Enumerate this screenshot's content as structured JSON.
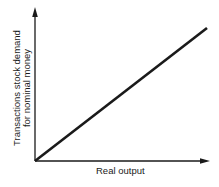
{
  "chart_data": {
    "type": "line",
    "title": "",
    "xlabel": "Real output",
    "ylabel": "Transactions stock demand for nominal money",
    "ylabel_lines": [
      "Transactions stock demand",
      "for nominal money"
    ],
    "x": [
      0,
      1
    ],
    "series": [
      {
        "name": "Transactions demand",
        "values": [
          0,
          0.75
        ]
      }
    ],
    "xlim": [
      0,
      1
    ],
    "ylim": [
      0,
      1
    ],
    "grid": false,
    "legend": "none",
    "ticks": "none",
    "annotations": []
  },
  "colors": {
    "axis": "#1a1a1a",
    "line": "#1a1a1a",
    "background": "#ffffff"
  }
}
